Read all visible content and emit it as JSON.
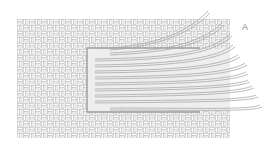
{
  "figure": {
    "panel_label": "A",
    "colors": {
      "background": "#ffffff",
      "weave": "#b5b5b5",
      "strand": "#a8a8a8",
      "frame": "#9a9a9a",
      "label": "#8a8a8a"
    },
    "weave_area": {
      "x": 17,
      "y": 19,
      "width": 213,
      "height": 119
    },
    "frame_rect": {
      "x": 87,
      "y": 48,
      "width": 113,
      "height": 64
    },
    "strand_count": 11
  }
}
